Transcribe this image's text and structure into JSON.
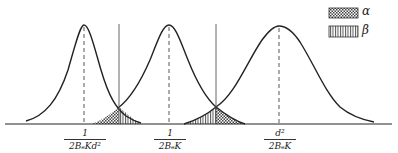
{
  "diagram": {
    "type": "overlapping normal distributions with decision thresholds",
    "curves": [
      {
        "name": "distribution-1",
        "center_label": {
          "numerator": "1",
          "denominator": "2BₑKd²"
        }
      },
      {
        "name": "distribution-2",
        "center_label": {
          "numerator": "1",
          "denominator": "2BₑK"
        }
      },
      {
        "name": "distribution-3",
        "center_label": {
          "numerator": "d²",
          "denominator": "2BₑK"
        }
      }
    ],
    "thresholds": 2,
    "legend": [
      {
        "symbol": "α",
        "pattern": "cross-hatched"
      },
      {
        "symbol": "β",
        "pattern": "vertical-lines"
      }
    ],
    "colors": {
      "line": "#222222",
      "background": "#ffffff",
      "alpha_fill": "#555555",
      "beta_fill": "#666666"
    }
  }
}
